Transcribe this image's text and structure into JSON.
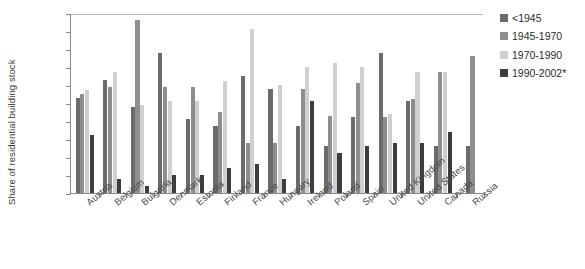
{
  "chart_data": {
    "type": "bar",
    "title": "",
    "subtitle": "",
    "xlabel": "",
    "ylabel": "Share of residential building stock",
    "ylim": [
      0,
      50
    ],
    "ytick_step": 5,
    "ytick_labels": [
      "0%",
      "5%",
      "10%",
      "15%",
      "20%",
      "25%",
      "30%",
      "35%",
      "40%",
      "45%",
      "50%"
    ],
    "ytick_values": [
      0,
      5,
      10,
      15,
      20,
      25,
      30,
      35,
      40,
      45,
      50
    ],
    "grid": false,
    "top_gridline": true,
    "legend_position": "right",
    "value_unit": "%",
    "categories": [
      "Austria",
      "Belgium",
      "Bulgaria",
      "Denmark",
      "Estonia",
      "Finland",
      "France",
      "Hungary",
      "Ireland",
      "Poland",
      "Spain",
      "United Kingdom",
      "United States",
      "Canada",
      "Russia"
    ],
    "series": [
      {
        "name": "<1945",
        "color": "#6b6b6b",
        "values": [
          26.5,
          31.5,
          24.0,
          39.0,
          20.5,
          18.5,
          32.5,
          29.0,
          18.5,
          13.0,
          21.0,
          39.0,
          25.5,
          13.0,
          13.0
        ]
      },
      {
        "name": "1945-1970",
        "color": "#8e8e8e",
        "values": [
          27.5,
          29.5,
          48.0,
          29.5,
          29.5,
          22.5,
          14.0,
          14.0,
          29.0,
          21.5,
          30.5,
          21.0,
          26.0,
          33.5,
          38.0
        ]
      },
      {
        "name": "1970-1990",
        "color": "#cfcfcf",
        "values": [
          28.5,
          33.5,
          24.5,
          25.5,
          25.5,
          31.0,
          45.5,
          30.0,
          35.0,
          36.0,
          35.0,
          22.0,
          33.5,
          33.5,
          null
        ]
      },
      {
        "name": "1990-2002*",
        "color": "#3d3d3d",
        "values": [
          16.0,
          4.0,
          2.0,
          5.0,
          5.0,
          7.0,
          8.0,
          4.0,
          25.5,
          11.0,
          13.0,
          14.0,
          14.0,
          17.0,
          null
        ]
      }
    ]
  },
  "legend": {
    "entries": [
      {
        "label": "<1945",
        "color": "#6b6b6b"
      },
      {
        "label": "1945-1970",
        "color": "#8e8e8e"
      },
      {
        "label": "1970-1990",
        "color": "#cfcfcf"
      },
      {
        "label": "1990-2002*",
        "color": "#3d3d3d"
      }
    ]
  }
}
